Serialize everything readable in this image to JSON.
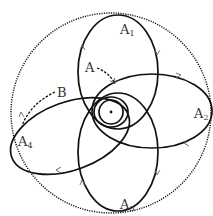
{
  "diagram": {
    "labels": {
      "a1": "A",
      "a1_sub": "1",
      "a2": "A",
      "a2_sub": "2",
      "a3": "A",
      "a3_sub": "3",
      "a4": "A",
      "a4_sub": "4",
      "a": "A",
      "b": "B"
    },
    "colors": {
      "stroke": "#111111",
      "label": "#333333",
      "background": "#ffffff"
    }
  }
}
